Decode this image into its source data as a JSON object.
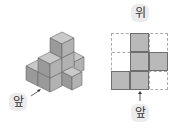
{
  "labels": {
    "top_view": "위",
    "front_left": "앞",
    "front_right": "앞"
  },
  "top_view_grid": {
    "rows": 3,
    "cols": 3,
    "filled": [
      [
        0,
        1
      ],
      [
        1,
        1
      ],
      [
        1,
        2
      ],
      [
        2,
        0
      ],
      [
        2,
        1
      ]
    ]
  },
  "colors": {
    "cube_top": "#c9c9c9",
    "cube_left": "#9a9a9a",
    "cube_right": "#b2b2b2",
    "grid_fill": "#b9b9b9",
    "grid_line": "#aaaaaa"
  }
}
